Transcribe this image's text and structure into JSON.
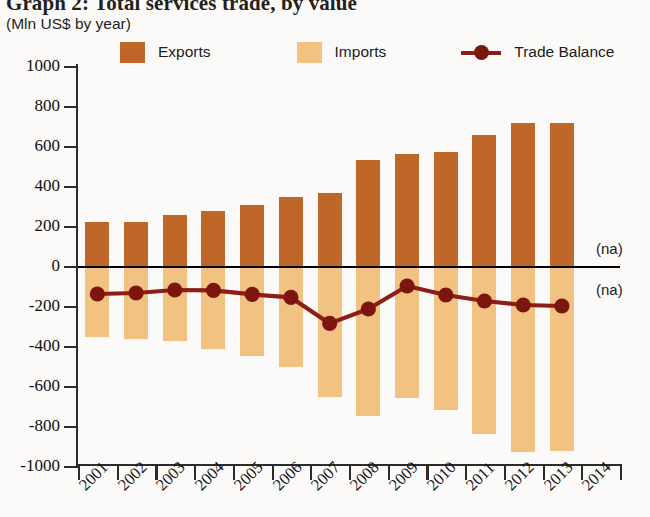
{
  "title": "Graph 2: Total services trade, by value",
  "subtitle": "(Mln US$ by year)",
  "legend": {
    "exports_label": "Exports",
    "imports_label": "Imports",
    "balance_label": "Trade Balance"
  },
  "colors": {
    "exports": "#bf6629",
    "imports": "#f2c283",
    "balance": "#8c1d17",
    "axis": "#2b2b2b"
  },
  "annotations": {
    "na_top": "(na)",
    "na_bottom": "(na)"
  },
  "chart_data": {
    "type": "bar",
    "title": "Graph 2: Total services trade, by value",
    "subtitle": "(Mln US$ by year)",
    "xlabel": "",
    "ylabel": "Mln US$ by year",
    "ylim": [
      -1000,
      1000
    ],
    "yticks": [
      1000,
      800,
      600,
      400,
      200,
      0,
      -200,
      -400,
      -600,
      -800,
      -1000
    ],
    "ytick_labels": [
      "1000",
      "800",
      "600",
      "400",
      "200",
      "0",
      "-200",
      "-400",
      "-600",
      "-800",
      "-1000"
    ],
    "grid": false,
    "legend_position": "top",
    "categories": [
      "2001",
      "2002",
      "2003",
      "2004",
      "2005",
      "2006",
      "2007",
      "2008",
      "2009",
      "2010",
      "2011",
      "2012",
      "2013",
      "2014"
    ],
    "series": [
      {
        "name": "Exports",
        "type": "bar",
        "color": "#bf6629",
        "values": [
          220,
          220,
          255,
          275,
          305,
          345,
          365,
          530,
          560,
          570,
          655,
          715,
          715,
          null
        ]
      },
      {
        "name": "Imports",
        "type": "bar",
        "color": "#f2c283",
        "values": [
          -355,
          -365,
          -375,
          -415,
          -450,
          -505,
          -655,
          -750,
          -660,
          -720,
          -840,
          -930,
          -925,
          null
        ]
      },
      {
        "name": "Trade Balance",
        "type": "line",
        "color": "#8c1d17",
        "values": [
          -140,
          -135,
          -120,
          -122,
          -142,
          -157,
          -287,
          -215,
          -100,
          -145,
          -175,
          -195,
          -200,
          null
        ]
      }
    ]
  }
}
